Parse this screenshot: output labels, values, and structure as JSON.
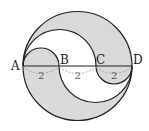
{
  "diagram": {
    "points": [
      "A",
      "B",
      "C",
      "D"
    ],
    "segments": [
      {
        "from": "A",
        "to": "B",
        "length": "2"
      },
      {
        "from": "B",
        "to": "C",
        "length": "2"
      },
      {
        "from": "C",
        "to": "D",
        "length": "2"
      }
    ],
    "colors": {
      "shade": "#d9d9d9",
      "line": "#222222",
      "brace": "#999999"
    }
  }
}
